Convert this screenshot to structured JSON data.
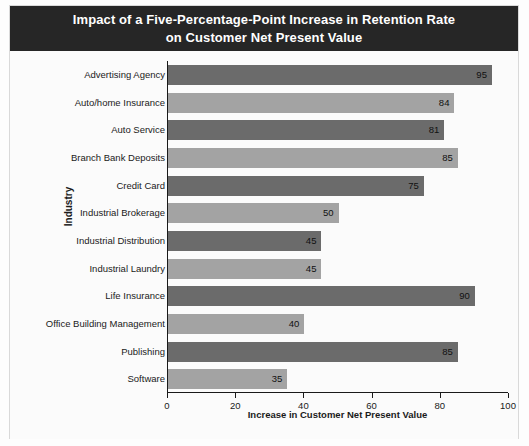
{
  "figure": {
    "title": "Impact of a Five-Percentage-Point Increase in Retention Rate\non Customer Net Present Value",
    "title_bar_color": "#262626",
    "title_text_color": "#ffffff",
    "background_color": "#fbfbfb"
  },
  "chart_data": {
    "type": "bar",
    "orientation": "horizontal",
    "title": "Impact of a Five-Percentage-Point Increase in Retention Rate on Customer Net Present Value",
    "xlabel": "Increase in Customer Net Present Value",
    "ylabel": "Industry",
    "xlim": [
      0,
      100
    ],
    "xticks": [
      0,
      20,
      40,
      60,
      80,
      100
    ],
    "xtick_labels": [
      "0",
      "20",
      "40",
      "60",
      "80",
      "100"
    ],
    "grid": false,
    "legend": "none",
    "bar_colors": [
      "#6b6b6b",
      "#a3a3a3"
    ],
    "categories": [
      "Advertising Agency",
      "Auto/home Insurance",
      "Auto Service",
      "Branch Bank Deposits",
      "Credit Card",
      "Industrial Brokerage",
      "Industrial Distribution",
      "Industrial Laundry",
      "Life Insurance",
      "Office Building Management",
      "Publishing",
      "Software"
    ],
    "values": [
      95,
      84,
      81,
      85,
      75,
      50,
      45,
      45,
      90,
      40,
      85,
      35
    ],
    "value_labels": [
      "95",
      "84",
      "81",
      "85",
      "75",
      "50",
      "45",
      "45",
      "90",
      "40",
      "85",
      "35"
    ]
  }
}
